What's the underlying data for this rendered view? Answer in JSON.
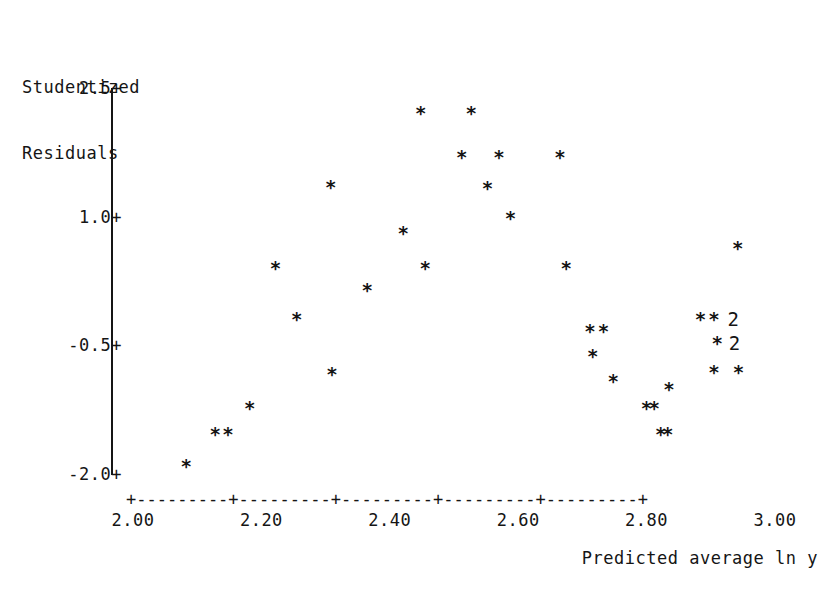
{
  "chart_data": {
    "type": "scatter",
    "title": "",
    "xlabel": "Predicted average ln y",
    "ylabel": "Studentized Residuals",
    "ylabel_lines": [
      "Studentized",
      "Residuals"
    ],
    "xlim": [
      2.0,
      3.0
    ],
    "ylim": [
      -2.0,
      2.5
    ],
    "xticks": [
      2.0,
      2.2,
      2.4,
      2.6,
      2.8,
      3.0
    ],
    "xtick_labels": [
      "2.00",
      "2.20",
      "2.40",
      "2.60",
      "2.80",
      "3.00"
    ],
    "yticks": [
      2.5,
      1.0,
      -0.5,
      -2.0
    ],
    "ytick_labels": [
      "2.5+",
      "1.0+",
      "-0.5+",
      "-2.0+"
    ],
    "grid": false,
    "legend": null,
    "marker": "*",
    "overplot_marker_note": "digit shows number of coincident points",
    "axis_style": "character-plot: y axis drawn as vertical bar, x axis drawn as +---------+ dashes",
    "x_axis_ascii": "+---------+---------+---------+---------+---------+",
    "points": [
      {
        "x": 2.083,
        "y": -1.92,
        "label": "*"
      },
      {
        "x": 2.128,
        "y": -1.55,
        "label": "*"
      },
      {
        "x": 2.148,
        "y": -1.55,
        "label": "*"
      },
      {
        "x": 2.182,
        "y": -1.24,
        "label": "*"
      },
      {
        "x": 2.222,
        "y": 0.39,
        "label": "*"
      },
      {
        "x": 2.255,
        "y": -0.21,
        "label": "*"
      },
      {
        "x": 2.308,
        "y": 1.33,
        "label": "*"
      },
      {
        "x": 2.31,
        "y": -0.85,
        "label": "*"
      },
      {
        "x": 2.365,
        "y": 0.13,
        "label": "*"
      },
      {
        "x": 2.421,
        "y": 0.8,
        "label": "*"
      },
      {
        "x": 2.448,
        "y": 2.2,
        "label": "*"
      },
      {
        "x": 2.455,
        "y": 0.39,
        "label": "*"
      },
      {
        "x": 2.512,
        "y": 1.68,
        "label": "*"
      },
      {
        "x": 2.527,
        "y": 2.2,
        "label": "*"
      },
      {
        "x": 2.552,
        "y": 1.32,
        "label": "*"
      },
      {
        "x": 2.57,
        "y": 1.68,
        "label": "*"
      },
      {
        "x": 2.588,
        "y": 0.97,
        "label": "*"
      },
      {
        "x": 2.665,
        "y": 1.68,
        "label": "*"
      },
      {
        "x": 2.675,
        "y": 0.39,
        "label": "*"
      },
      {
        "x": 2.712,
        "y": -0.35,
        "label": "*"
      },
      {
        "x": 2.733,
        "y": -0.35,
        "label": "*"
      },
      {
        "x": 2.716,
        "y": -0.64,
        "label": "*"
      },
      {
        "x": 2.748,
        "y": -0.93,
        "label": "*"
      },
      {
        "x": 2.8,
        "y": -1.24,
        "label": "*"
      },
      {
        "x": 2.812,
        "y": -1.24,
        "label": "*"
      },
      {
        "x": 2.822,
        "y": -1.55,
        "label": "*"
      },
      {
        "x": 2.833,
        "y": -1.55,
        "label": "*"
      },
      {
        "x": 2.835,
        "y": -1.02,
        "label": "*"
      },
      {
        "x": 2.884,
        "y": -0.21,
        "label": "*"
      },
      {
        "x": 2.905,
        "y": -0.21,
        "label": "*"
      },
      {
        "x": 2.935,
        "y": -0.21,
        "label": "2"
      },
      {
        "x": 2.91,
        "y": -0.49,
        "label": "*"
      },
      {
        "x": 2.937,
        "y": -0.49,
        "label": "2"
      },
      {
        "x": 2.905,
        "y": -0.82,
        "label": "*"
      },
      {
        "x": 2.943,
        "y": -0.82,
        "label": "*"
      },
      {
        "x": 2.942,
        "y": 0.62,
        "label": "*"
      }
    ]
  }
}
